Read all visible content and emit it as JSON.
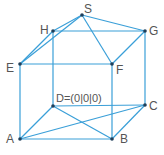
{
  "diagram": {
    "colors": {
      "edge": "#3a9fd8",
      "point": "#1f3f5a",
      "label": "#555555"
    },
    "points": {
      "A": {
        "label": "A",
        "x": 20,
        "y": 139
      },
      "B": {
        "label": "B",
        "x": 112,
        "y": 139
      },
      "C": {
        "label": "C",
        "x": 145,
        "y": 105
      },
      "D": {
        "label": "D=(0|0|0)",
        "x": 53,
        "y": 106
      },
      "E": {
        "label": "E",
        "x": 20,
        "y": 64
      },
      "F": {
        "label": "F",
        "x": 112,
        "y": 64
      },
      "G": {
        "label": "G",
        "x": 145,
        "y": 31
      },
      "H": {
        "label": "H",
        "x": 53,
        "y": 31
      },
      "S": {
        "label": "S",
        "x": 82,
        "y": 15
      }
    },
    "edges": [
      [
        "A",
        "B"
      ],
      [
        "B",
        "C"
      ],
      [
        "C",
        "D"
      ],
      [
        "D",
        "A"
      ],
      [
        "E",
        "F"
      ],
      [
        "F",
        "G"
      ],
      [
        "G",
        "H"
      ],
      [
        "H",
        "E"
      ],
      [
        "A",
        "E"
      ],
      [
        "B",
        "F"
      ],
      [
        "C",
        "G"
      ],
      [
        "D",
        "H"
      ],
      [
        "S",
        "E"
      ],
      [
        "S",
        "F"
      ],
      [
        "S",
        "G"
      ],
      [
        "S",
        "H"
      ],
      [
        "A",
        "C"
      ],
      [
        "D",
        "B"
      ]
    ]
  }
}
